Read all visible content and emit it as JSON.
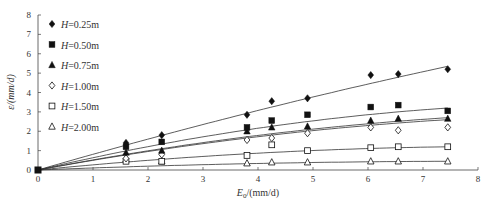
{
  "chart_data": {
    "type": "scatter",
    "title": "",
    "xlabel": "E0/(mm/d)",
    "xlabel_main": "E",
    "xlabel_sub": "0",
    "xlabel_rest": "/(mm/d)",
    "ylabel": "ε/(mm/d)",
    "xlim": [
      0,
      8
    ],
    "ylim": [
      0,
      8
    ],
    "xticks": [
      0,
      1,
      2,
      3,
      4,
      5,
      6,
      7,
      8
    ],
    "yticks": [
      0,
      1,
      2,
      3,
      4,
      5,
      6,
      7,
      8
    ],
    "grid": false,
    "legend_position": "upper-left",
    "x": [
      0,
      1.6,
      2.25,
      3.8,
      4.25,
      4.9,
      6.05,
      6.55,
      7.45
    ],
    "series": [
      {
        "name": "H=0.25m",
        "marker": "diamond-filled",
        "values": [
          0,
          1.4,
          1.8,
          2.85,
          3.55,
          3.7,
          4.9,
          4.95,
          5.2
        ],
        "fit_end": 5.35,
        "fit_curv": 0.15
      },
      {
        "name": "H=0.50m",
        "marker": "square-filled",
        "values": [
          0,
          1.2,
          1.45,
          2.2,
          2.55,
          2.85,
          3.25,
          3.35,
          3.05
        ],
        "fit_end": 3.2,
        "fit_curv": 0.55
      },
      {
        "name": "H=0.75m",
        "marker": "triangle-filled",
        "values": [
          0,
          0.9,
          1.0,
          2.0,
          2.2,
          2.25,
          2.55,
          2.65,
          2.65
        ],
        "fit_end": 2.7,
        "fit_curv": 0.5
      },
      {
        "name": "H=1.00m",
        "marker": "diamond-open",
        "values": [
          0,
          0.6,
          0.8,
          1.55,
          1.65,
          1.9,
          2.2,
          2.05,
          2.2
        ],
        "fit_end": 2.6,
        "fit_curv": 0.5
      },
      {
        "name": "H=1.50m",
        "marker": "square-open",
        "values": [
          0,
          0.45,
          0.45,
          0.75,
          1.3,
          1.0,
          1.15,
          1.2,
          1.2
        ],
        "fit_end": 1.2,
        "fit_curv": 0.75
      },
      {
        "name": "H=2.00m",
        "marker": "triangle-open",
        "values": [
          0,
          0.55,
          0.45,
          0.35,
          0.4,
          0.4,
          0.45,
          0.45,
          0.45
        ],
        "fit_end": 0.45,
        "fit_curv": 0.85
      }
    ]
  },
  "legend": {
    "items": [
      {
        "prefix": "H",
        "suffix": "=0.25m"
      },
      {
        "prefix": "H",
        "suffix": "=0.50m"
      },
      {
        "prefix": "H",
        "suffix": "=0.75m"
      },
      {
        "prefix": "H",
        "suffix": "=1.00m"
      },
      {
        "prefix": "H",
        "suffix": "=1.50m"
      },
      {
        "prefix": "H",
        "suffix": "=2.00m"
      }
    ]
  },
  "colors": {
    "axis": "#444444",
    "marker": "#111111",
    "fit": "#333333"
  }
}
